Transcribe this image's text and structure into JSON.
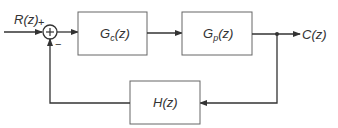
{
  "diagram": {
    "type": "feedback-control-block-diagram",
    "input": {
      "label": "R(z)"
    },
    "output": {
      "label": "C(z)"
    },
    "summing_junction": {
      "plus_sign": "+",
      "minus_sign": "−",
      "symbol": "+"
    },
    "blocks": [
      {
        "id": "controller",
        "label_main": "G",
        "label_sub": "c",
        "label_arg": "(z)"
      },
      {
        "id": "plant",
        "label_main": "G",
        "label_sub": "p",
        "label_arg": "(z)"
      },
      {
        "id": "feedback",
        "label_main": "H",
        "label_sub": "",
        "label_arg": "(z)"
      }
    ],
    "connections": [
      {
        "from": "R(z)",
        "to": "summing_junction",
        "sign": "+"
      },
      {
        "from": "summing_junction",
        "to": "controller"
      },
      {
        "from": "controller",
        "to": "plant"
      },
      {
        "from": "plant",
        "to": "C(z)"
      },
      {
        "from": "C(z)",
        "to": "feedback"
      },
      {
        "from": "feedback",
        "to": "summing_junction",
        "sign": "-"
      }
    ],
    "colors": {
      "line": "#333333",
      "box": "#555555",
      "background": "#ffffff"
    }
  }
}
